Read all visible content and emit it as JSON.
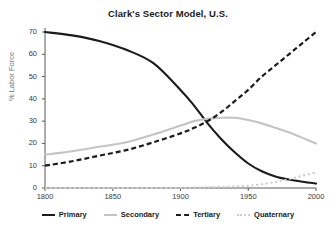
{
  "chart_data": {
    "type": "line",
    "title": "Clark's Sector Model, U.S.",
    "xlabel": "",
    "ylabel": "% Labor Force",
    "xlim": [
      1800,
      2000
    ],
    "ylim": [
      0,
      70
    ],
    "xticks": [
      "1800",
      "1850",
      "1900",
      "1950",
      "2000"
    ],
    "yticks": [
      "0",
      "10",
      "20",
      "30",
      "40",
      "50",
      "60",
      "70"
    ],
    "grid": false,
    "legend_position": "bottom",
    "x": [
      1800,
      1820,
      1840,
      1860,
      1880,
      1900,
      1910,
      1920,
      1930,
      1940,
      1950,
      1960,
      1970,
      1980,
      1990,
      2000
    ],
    "series": [
      {
        "name": "Primary",
        "color": "#1b1b1b",
        "style": "solid",
        "values": [
          70,
          68.5,
          66,
          62,
          56,
          44,
          37,
          29,
          22,
          16,
          11,
          7.5,
          5.2,
          3.8,
          2.8,
          2
        ]
      },
      {
        "name": "Secondary",
        "color": "#c4c4c4",
        "style": "solid",
        "values": [
          15,
          16.5,
          18.5,
          20.5,
          24,
          28,
          30,
          31,
          31.5,
          31.5,
          30.5,
          29,
          27,
          25,
          22.5,
          20
        ]
      },
      {
        "name": "Tertiary",
        "color": "#1b1b1b",
        "style": "dashed",
        "values": [
          10,
          12,
          14.5,
          17,
          20.5,
          24.5,
          27,
          30,
          34,
          39,
          44,
          50,
          55,
          60,
          65,
          70
        ]
      },
      {
        "name": "Quaternary",
        "color": "#cfcfcf",
        "style": "dotted",
        "values": [
          0,
          0,
          0,
          0,
          0,
          0.1,
          0.2,
          0.3,
          0.5,
          0.7,
          1,
          1.7,
          2.7,
          4,
          5.5,
          7
        ]
      }
    ]
  },
  "legend": {
    "items": [
      {
        "label": "Primary"
      },
      {
        "label": "Secondary"
      },
      {
        "label": "Tertiary"
      },
      {
        "label": "Quaternary"
      }
    ]
  }
}
